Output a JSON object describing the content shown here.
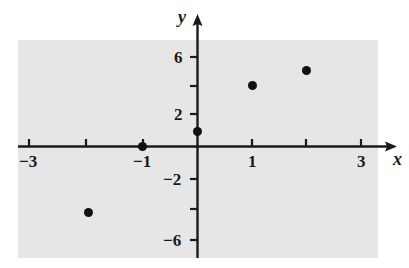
{
  "chart_data": {
    "type": "scatter",
    "title": "",
    "xlabel": "x",
    "ylabel": "y",
    "xlim": [
      -3.5,
      3.6
    ],
    "ylim": [
      -7.0,
      7.2
    ],
    "grid": false,
    "legend": "none",
    "x_ticks": [
      -3,
      -2,
      -1,
      1,
      2,
      3
    ],
    "x_tick_labels": [
      "−3",
      "",
      "−1",
      "1",
      "",
      "3"
    ],
    "y_ticks": [
      -6,
      -4,
      -2,
      2,
      4,
      6
    ],
    "y_tick_labels": [
      "−6",
      "",
      "−2",
      "2",
      "",
      "6"
    ],
    "points": [
      {
        "x": -2,
        "y": -4.3
      },
      {
        "x": -1,
        "y": 0
      },
      {
        "x": 0,
        "y": 1
      },
      {
        "x": 1,
        "y": 4
      },
      {
        "x": 2,
        "y": 5
      }
    ],
    "marker": "filled-circle",
    "marker_color": "#111111",
    "plot_background_color": "#e6e6e6",
    "axis_color": "#1a1a1a"
  },
  "labels": {
    "x_axis_name": "x",
    "y_axis_name": "y",
    "x_neg3": "−3",
    "x_neg1": "−1",
    "x_pos1": "1",
    "x_pos3": "3",
    "y_pos6": "6",
    "y_pos2": "2",
    "y_neg2": "−2",
    "y_neg6": "−6"
  }
}
